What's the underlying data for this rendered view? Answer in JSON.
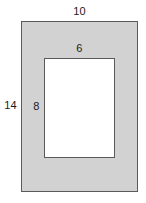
{
  "figure": {
    "name": "nested-rectangles-dimension-diagram",
    "colors": {
      "frame_fill": "#d2d2d2",
      "opening_fill": "#ffffff",
      "stroke": "#5a5a5a",
      "label_text": "#1a1a1a",
      "background": "#ffffff"
    },
    "outer_rectangle": {
      "name": "outer-rectangle",
      "width_label": "10",
      "height_label": "14"
    },
    "inner_rectangle": {
      "name": "inner-rectangle",
      "width_label": "6",
      "height_label": "8"
    }
  },
  "chart_data": {
    "type": "diagram",
    "title": "",
    "shapes": [
      {
        "id": "outer",
        "kind": "rectangle",
        "fill": "#d2d2d2",
        "stroke": "#5a5a5a",
        "width": 10,
        "height": 14,
        "labels": [
          {
            "text": "10",
            "side": "top"
          },
          {
            "text": "14",
            "side": "left"
          }
        ]
      },
      {
        "id": "inner",
        "kind": "rectangle",
        "fill": "#ffffff",
        "stroke": "#5a5a5a",
        "width": 6,
        "height": 8,
        "labels": [
          {
            "text": "6",
            "side": "top"
          },
          {
            "text": "8",
            "side": "left"
          }
        ]
      }
    ]
  }
}
